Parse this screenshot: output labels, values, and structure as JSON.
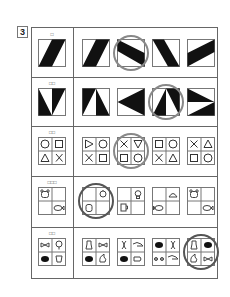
{
  "question_number": "3",
  "rows": [
    {
      "id": "row-1",
      "marker": "□",
      "answer_index": 1,
      "figure_type": "parallelogram-bars",
      "options": [
        "bar-slant-right",
        "bar-slant-right",
        "bar-slant-down-left",
        "bar-slant-down-right",
        "bar-slant-shallow"
      ]
    },
    {
      "id": "row-2",
      "marker": "□□",
      "answer_index": 2,
      "figure_type": "split-triangles",
      "options": [
        "v-triangles",
        "a-triangles",
        "left-arrow-triangles",
        "a-triangles-inverted",
        "right-arrow-triangles"
      ]
    },
    {
      "id": "row-3",
      "marker": "□□",
      "answer_index": 1,
      "figure_type": "symbol-grid",
      "prompt": [
        "○",
        "□",
        "△",
        "×"
      ],
      "options": [
        [
          "▷",
          "○",
          "×",
          "□"
        ],
        [
          "×",
          "▽",
          "□",
          "○"
        ],
        [
          "□",
          "○",
          "×",
          "△"
        ],
        [
          "×",
          "△",
          "□",
          "○"
        ]
      ]
    },
    {
      "id": "row-4",
      "marker": "□□□",
      "answer_index": 0,
      "figure_type": "icon-grid",
      "prompt": [
        "bear",
        "",
        "",
        "fish"
      ],
      "options": [
        [
          "",
          "bird",
          "face",
          ""
        ],
        [
          "",
          "bulb",
          "mug",
          ""
        ],
        [
          "",
          "basket",
          "fish",
          ""
        ],
        [
          "bear",
          "",
          "",
          "fish"
        ]
      ]
    },
    {
      "id": "row-5",
      "marker": "□□",
      "answer_index": 3,
      "figure_type": "icon-grid",
      "prompt": [
        "bowtie",
        "tree",
        "ball",
        "cup"
      ],
      "options": [
        [
          "vase",
          "bowtie",
          "ball",
          "hand"
        ],
        [
          "dna",
          "hand",
          "ball",
          "shoe"
        ],
        [
          "ball",
          "dna",
          "glasses",
          "shoe"
        ],
        [
          "vase",
          "ball",
          "hand",
          "bowtie"
        ]
      ]
    }
  ],
  "colors": {
    "ink": "#111111",
    "border": "#666666",
    "ring": "#888888"
  }
}
